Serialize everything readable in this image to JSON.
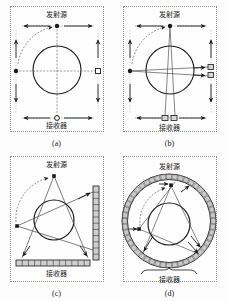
{
  "figure": {
    "title": "",
    "caption_font": "serif",
    "colors": {
      "stroke": "#1a1a1a",
      "frame": "#8d8d8d",
      "detector_fill": "#c9c9c9",
      "background": "#fdfdfd"
    }
  },
  "labels": {
    "emitter": "发射源",
    "receiver": "接收器"
  },
  "panels": [
    {
      "id": "a",
      "caption": "(a)",
      "geometry": "parallel-beam translate-rotate",
      "emitter_label": "发射源",
      "receiver_label": "接收器",
      "source_type": "single point source",
      "detector_type": "single detector",
      "beam_count": 1,
      "ring_detectors": 0
    },
    {
      "id": "b",
      "caption": "(b)",
      "geometry": "narrow fan-beam translate-rotate",
      "emitter_label": "发射源",
      "receiver_label": "接收器",
      "source_type": "single point source",
      "detector_type": "small detector array",
      "beam_count": 2,
      "ring_detectors": 0
    },
    {
      "id": "c",
      "caption": "(c)",
      "geometry": "wide fan-beam rotate only",
      "emitter_label": "发射源",
      "receiver_label": "接收器",
      "source_type": "single point source",
      "detector_type": "linear detector array",
      "beam_count": 3,
      "ring_detectors": 0
    },
    {
      "id": "d",
      "caption": "(d)",
      "geometry": "stationary ring detector, rotating source",
      "emitter_label": "发射源",
      "receiver_label": "接收器",
      "source_type": "rotating point source",
      "detector_type": "full circular detector ring",
      "beam_count": 3,
      "ring_detectors": 48
    }
  ]
}
